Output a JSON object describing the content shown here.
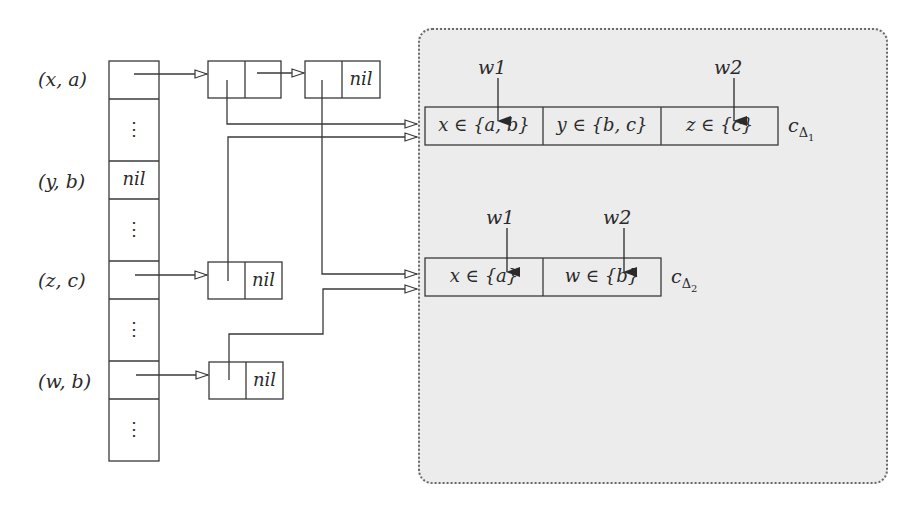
{
  "diagram": {
    "type": "hash-table-to-constraint-watch-lists",
    "hash_table": {
      "rows": [
        {
          "key": "(x, a)",
          "cell": "pointer"
        },
        {
          "key": "",
          "cell": "⋮"
        },
        {
          "key": "(y, b)",
          "cell": "nil"
        },
        {
          "key": "",
          "cell": "⋮"
        },
        {
          "key": "(z, c)",
          "cell": "pointer"
        },
        {
          "key": "",
          "cell": "⋮"
        },
        {
          "key": "(w, b)",
          "cell": "pointer"
        },
        {
          "key": "",
          "cell": "⋮"
        }
      ]
    },
    "lists": {
      "xa_node1": {
        "next": "pointer"
      },
      "xa_node2": {
        "next": "nil"
      },
      "zc_node": {
        "next": "nil"
      },
      "wb_node": {
        "next": "nil"
      }
    },
    "constraints": [
      {
        "name": "c_Δ1",
        "name_base": "c",
        "name_sub": "Δ",
        "name_subsub": "1",
        "cells": [
          "x ∈ {a, b}",
          "y ∈ {b, c}",
          "z ∈ {c}"
        ],
        "watchers": [
          {
            "label": "w1",
            "cell": 0
          },
          {
            "label": "w2",
            "cell": 2
          }
        ]
      },
      {
        "name": "c_Δ2",
        "name_base": "c",
        "name_sub": "Δ",
        "name_subsub": "2",
        "cells": [
          "x ∈ {a}",
          "w ∈ {b}"
        ],
        "watchers": [
          {
            "label": "w1",
            "cell": 0
          },
          {
            "label": "w2",
            "cell": 1
          }
        ]
      }
    ],
    "edges": [
      {
        "from": "hash(x,a)",
        "to": "xa_node1"
      },
      {
        "from": "xa_node1.next",
        "to": "xa_node2"
      },
      {
        "from": "xa_node1",
        "to": "c_Δ1"
      },
      {
        "from": "zc_node",
        "to": "c_Δ1"
      },
      {
        "from": "xa_node2",
        "to": "c_Δ2"
      },
      {
        "from": "wb_node",
        "to": "c_Δ2"
      },
      {
        "from": "hash(z,c)",
        "to": "zc_node"
      },
      {
        "from": "hash(w,b)",
        "to": "wb_node"
      }
    ],
    "colors": {
      "stroke": "#3a3a3a",
      "store_fill": "#ececec",
      "store_border": "#555555"
    },
    "nil_label": "nil"
  }
}
